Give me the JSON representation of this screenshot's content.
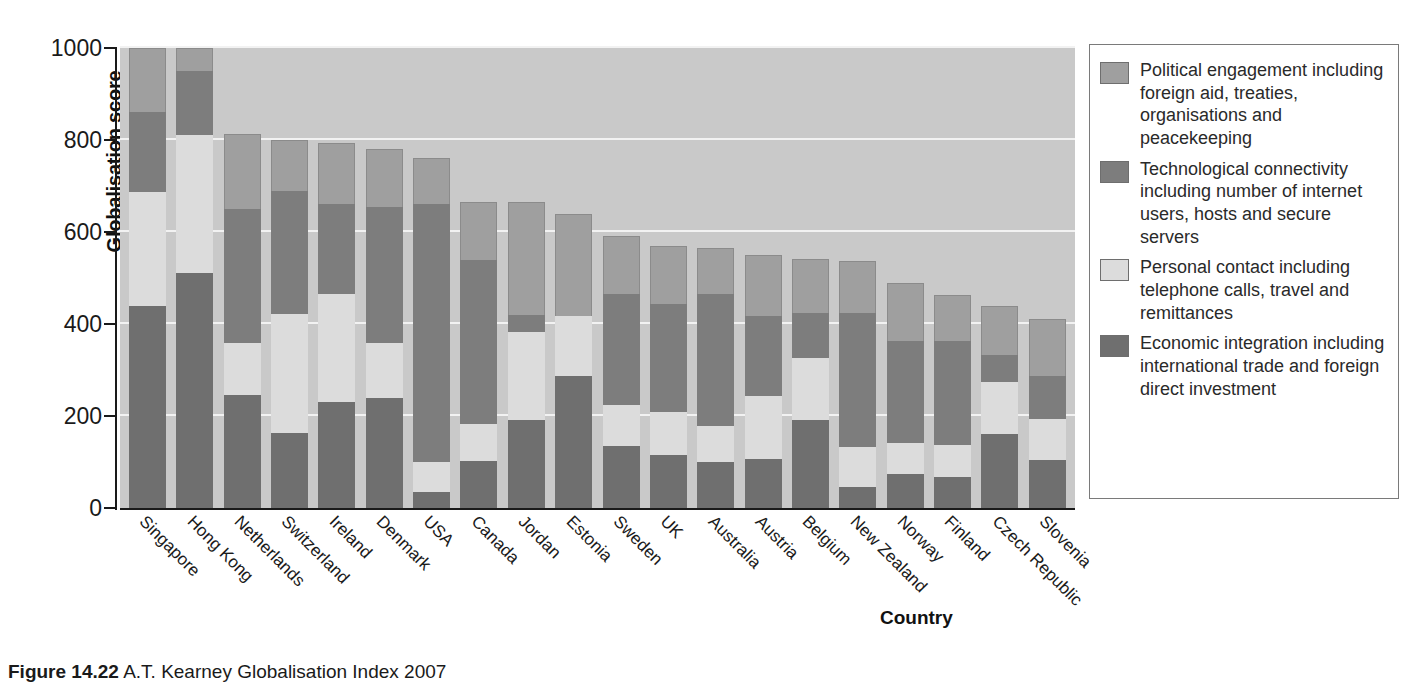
{
  "chart_data": {
    "type": "bar",
    "subtype": "stacked-vertical",
    "title": "",
    "xlabel": "Country",
    "ylabel": "Globalisation score",
    "ylim": [
      0,
      1000
    ],
    "yticks": [
      0,
      200,
      400,
      600,
      800,
      1000
    ],
    "grid": true,
    "legend_position": "right",
    "stack_order_bottom_to_top": [
      "Economic integration",
      "Personal contact",
      "Technological connectivity",
      "Political engagement"
    ],
    "categories": [
      "Singapore",
      "Hong Kong",
      "Netherlands",
      "Switzerland",
      "Ireland",
      "Denmark",
      "USA",
      "Canada",
      "Jordan",
      "Estonia",
      "Sweden",
      "UK",
      "Australia",
      "Austria",
      "Belgium",
      "New Zealand",
      "Norway",
      "Finland",
      "Czech Republic",
      "Slovenia"
    ],
    "series": [
      {
        "name": "Economic integration including international trade and foreign direct investment",
        "color": "#6f6f6f",
        "values": [
          440,
          511,
          246,
          163,
          230,
          239,
          35,
          102,
          192,
          287,
          135,
          116,
          100,
          106,
          192,
          46,
          75,
          68,
          160,
          104
        ]
      },
      {
        "name": "Personal contact including telephone calls, travel and remittances",
        "color": "#dcdcdc",
        "values": [
          248,
          300,
          113,
          259,
          236,
          119,
          66,
          80,
          190,
          130,
          88,
          93,
          79,
          137,
          135,
          87,
          66,
          68,
          115,
          89
        ]
      },
      {
        "name": "Technological connectivity including number of internet users, hosts and secure servers",
        "color": "#7d7d7d",
        "values": [
          172,
          140,
          291,
          267,
          194,
          297,
          560,
          358,
          38,
          0,
          242,
          234,
          286,
          174,
          98,
          292,
          223,
          227,
          58,
          95
        ]
      },
      {
        "name": "Political engagement including foreign aid, treaties, organisations and peacekeeping",
        "color": "#9f9f9f",
        "values": [
          140,
          49,
          163,
          111,
          134,
          125,
          99,
          125,
          245,
          222,
          127,
          127,
          100,
          133,
          116,
          111,
          126,
          100,
          107,
          123
        ]
      }
    ],
    "totals": [
      1000,
      1000,
      813,
      800,
      794,
      780,
      760,
      665,
      665,
      639,
      592,
      570,
      565,
      550,
      541,
      536,
      490,
      463,
      440,
      411
    ]
  },
  "axes": {
    "y_title": "Globalisation score",
    "x_title": "Country",
    "y_tick_labels": [
      "1000",
      "800",
      "600",
      "400",
      "200",
      "0"
    ]
  },
  "legend": {
    "items": [
      {
        "swatch": "sw-political",
        "label": "Political engagement including foreign aid, treaties, organisations and peacekeeping"
      },
      {
        "swatch": "sw-tech",
        "label": "Technological connectivity including number of internet users, hosts and secure servers"
      },
      {
        "swatch": "sw-personal",
        "label": "Personal contact including telephone calls, travel and remittances"
      },
      {
        "swatch": "sw-econ",
        "label": "Economic integration including international trade and foreign direct investment"
      }
    ]
  },
  "caption": {
    "figure_number": "Figure 14.22",
    "text": "A.T. Kearney Globalisation Index 2007"
  },
  "colors": {
    "plot_background": "#c9c9c9",
    "gridline": "#f2f2f2",
    "political": "#9f9f9f",
    "technological": "#7d7d7d",
    "personal": "#dcdcdc",
    "economic": "#6f6f6f",
    "axis": "#1a1a1a"
  }
}
